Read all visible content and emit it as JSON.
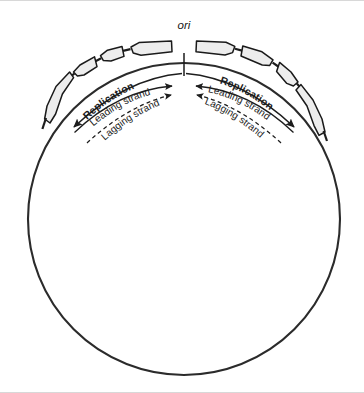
{
  "figure": {
    "name": "bacterial-chromosome-replication-diagram",
    "background_color": "#ffffff",
    "stroke_color": "#2b2b2b",
    "gene_fill_color": "#ededed",
    "gene_stroke_color": "#1a1a1a"
  },
  "origin": {
    "label": "ori",
    "tick": "origin-tick-mark"
  },
  "left_fork": {
    "replication_label": "Replication",
    "leading_label": "Leading strand",
    "lagging_label": "Lagging strand"
  },
  "right_fork": {
    "replication_label": "Replication",
    "leading_label": "Leading strand",
    "lagging_label": "Lagging strand"
  },
  "chromosome": {
    "center_x": 184,
    "center_y": 218,
    "radius": 156
  },
  "genes": {
    "count": 8,
    "left_side": 4,
    "right_side": 4
  }
}
